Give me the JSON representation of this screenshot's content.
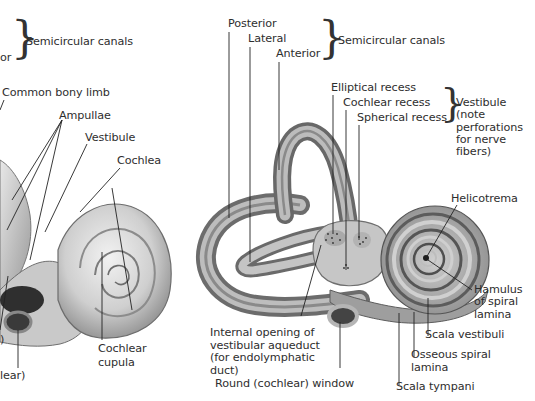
{
  "left_figure": {
    "labels": {
      "semicircular_canals_partial_left": "or",
      "semicircular_canals": "Semicircular canals",
      "common_bony_limb": "Common bony limb",
      "ampullae": "Ampullae",
      "vestibule": "Vestibule",
      "cochlea": "Cochlea",
      "cochlear_cupula": "Cochlear\ncupula",
      "partial_paren": ")",
      "partial_cochlear": "lear)"
    }
  },
  "right_figure": {
    "labels": {
      "posterior": "Posterior",
      "lateral": "Lateral",
      "anterior": "Anterior",
      "semicircular_canals": "Semicircular canals",
      "elliptical_recess": "Elliptical recess",
      "cochlear_recess": "Cochlear recess",
      "spherical_recess": "Spherical recess",
      "vestibule_note": "Vestibule\n(note\nperforations\nfor nerve\nfibers)",
      "helicotrema": "Helicotrema",
      "hamulus": "Hamulus\nof spiral\nlamina",
      "scala_vestibuli": "Scala vestibuli",
      "osseous_spiral_lamina": "Osseous spiral\nlamina",
      "scala_tympani": "Scala tympani",
      "round_window": "Round (cochlear) window",
      "internal_opening": "Internal opening of\nvestibular aqueduct\n(for endolymphatic\nduct)"
    }
  },
  "colors": {
    "bone_light": "#e2e2e2",
    "bone_mid": "#a8a8a8",
    "bone_dark": "#555555",
    "leader_line": "#222222"
  }
}
